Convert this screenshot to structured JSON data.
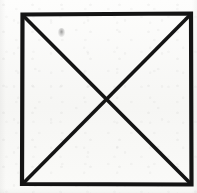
{
  "figure": {
    "medium": "scanned ink line drawing on paper",
    "canvas": {
      "width": 197,
      "height": 193
    },
    "colors": {
      "ink": "#141414",
      "paper": "#f8f8f6",
      "paper_light": "#fdfdfc",
      "smudge": "#8c8c8c"
    },
    "stroke": {
      "outline_width": 4.2,
      "diagonal_width": 3.6,
      "linecap": "square",
      "linejoin": "miter"
    },
    "square": {
      "label": "square-outline",
      "corners": {
        "top_left": {
          "x": 22.5,
          "y": 14.5
        },
        "top_right": {
          "x": 191.0,
          "y": 13.5
        },
        "bottom_right": {
          "x": 191.5,
          "y": 184.5
        },
        "bottom_left": {
          "x": 22.0,
          "y": 184.0
        }
      },
      "points": "22.5,14.5 191,13.5 191.5,184.5 22,184"
    },
    "diagonals": [
      {
        "label": "diagonal-tl-br",
        "from": {
          "x": 24.0,
          "y": 16.5
        },
        "to": {
          "x": 189.5,
          "y": 182.5
        }
      },
      {
        "label": "diagonal-tr-bl",
        "from": {
          "x": 189.0,
          "y": 16.0
        },
        "to": {
          "x": 24.5,
          "y": 182.0
        }
      }
    ],
    "intersection": {
      "label": "center-crossing",
      "x": 106.5,
      "y": 99.5
    },
    "marks": [
      {
        "label": "ink-smudge",
        "x": 58,
        "y": 28,
        "width": 7,
        "height": 9
      }
    ]
  }
}
